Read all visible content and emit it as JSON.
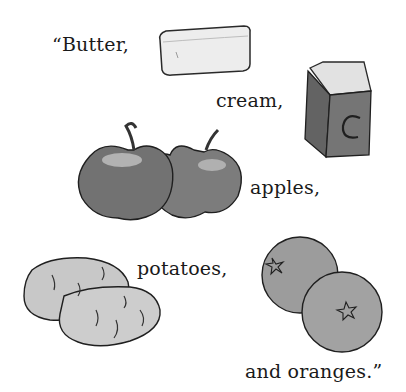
{
  "page": {
    "words": {
      "butter": "“Butter,",
      "cream": "cream,",
      "apples": "apples,",
      "potatoes": "potatoes,",
      "oranges": "and oranges.”"
    },
    "illustrations": [
      {
        "name": "butter-stick",
        "label": "stick of butter"
      },
      {
        "name": "cream-carton",
        "label": "cream carton",
        "mark": "C"
      },
      {
        "name": "apples",
        "label": "two apples"
      },
      {
        "name": "potatoes",
        "label": "two potatoes"
      },
      {
        "name": "oranges",
        "label": "two oranges"
      }
    ],
    "carton_letter": "C",
    "colors": {
      "background": "#ffffff",
      "ink": "#1a1a1a",
      "butter": "#ececec",
      "carton": "#6e6e6e",
      "apple": "#7a7a7a",
      "potato": "#c4c4c4",
      "orange": "#9a9a9a"
    }
  }
}
